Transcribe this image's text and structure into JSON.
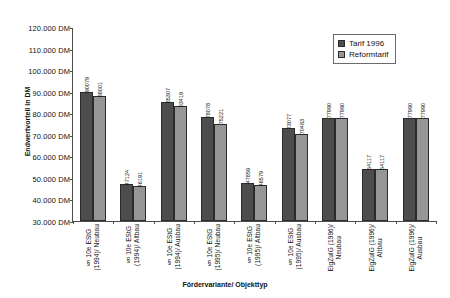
{
  "chart": {
    "title": "",
    "xlabel": "Fördervariante/ Objekttyp",
    "ylabel": "Endwertvorteil in DM"
  },
  "legend": {
    "items": [
      {
        "label": "Tarif 1996",
        "color": "#4d4d4d"
      },
      {
        "label": "Reformtarif",
        "color": "#969696"
      }
    ]
  },
  "yaxis": {
    "ticks": [
      "120.000 DM",
      "110.000 DM",
      "100.000 DM",
      "90.000 DM",
      "80.000 DM",
      "70.000 DM",
      "60.000 DM",
      "50.000 DM",
      "40.000 DM",
      "30.000 DM"
    ]
  },
  "chart_data": {
    "type": "bar",
    "title": "",
    "xlabel": "Fördervariante/ Objekttyp",
    "ylabel": "Endwertvorteil in DM",
    "ylim": [
      30000,
      120000
    ],
    "ytick_step": 10000,
    "grid": false,
    "legend_position": "top-right",
    "categories": [
      "§ 10e EStG\n(1994)/ Neubau",
      "§ 10e EStG\n(1994)/ Altbau",
      "§ 10e EStG\n(1994)/ Ausbau",
      "§ 10e EStG\n(1995)/ Neubau",
      "§ 10e EStG\n(1995)/ Altbau",
      "§ 10e EStG\n(1995)/ Ausbau",
      "EigZulG (1996)/\nNeubau",
      "EigZulG (1996)/\nAltbau",
      "EigZulG (1996)/\nAusbau"
    ],
    "series": [
      {
        "name": "Tarif 1996",
        "color": "#4d4d4d",
        "values": [
          90079,
          47124,
          85307,
          78078,
          47859,
          73077,
          77990,
          54117,
          77990
        ]
      },
      {
        "name": "Reformtarif",
        "color": "#969696",
        "values": [
          88001,
          46191,
          83419,
          75221,
          46579,
          70483,
          77990,
          54117,
          77990
        ]
      }
    ]
  }
}
